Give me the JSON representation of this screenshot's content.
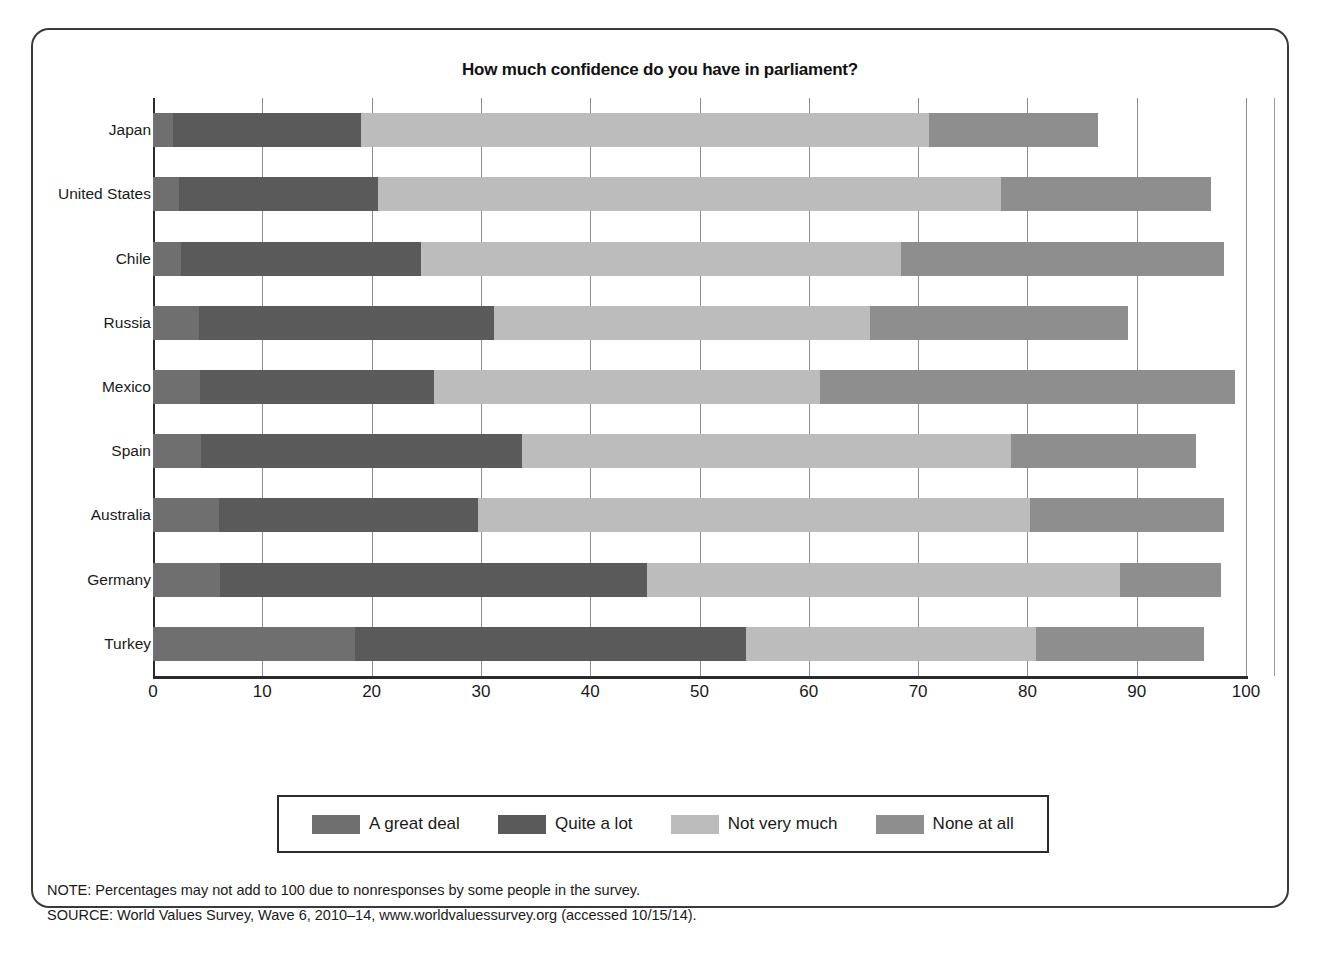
{
  "figure": {
    "title": "How much confidence do you have in parliament?"
  },
  "legend": {
    "items": [
      {
        "label": "A great deal",
        "color": "#6f6f6f"
      },
      {
        "label": "Quite a lot",
        "color": "#5a5a5a"
      },
      {
        "label": "Not very much",
        "color": "#bcbcbc"
      },
      {
        "label": "None at all",
        "color": "#8e8e8e"
      }
    ]
  },
  "footnotes": [
    "NOTE: Percentages may not add to 100 due to nonresponses by some people in the survey.",
    "SOURCE: World Values Survey, Wave 6, 2010–14, www.worldvaluessurvey.org (accessed 10/15/14)."
  ],
  "chart_data": {
    "type": "bar",
    "orientation": "horizontal",
    "stacked": true,
    "title": "How much confidence do you have in parliament?",
    "xlabel": "",
    "ylabel": "",
    "xlim": [
      0,
      100
    ],
    "xticks": [
      0,
      10,
      20,
      30,
      40,
      50,
      60,
      70,
      80,
      90,
      100
    ],
    "grid": true,
    "legend_position": "bottom",
    "categories": [
      "Japan",
      "United States",
      "Chile",
      "Russia",
      "Mexico",
      "Spain",
      "Australia",
      "Germany",
      "Turkey"
    ],
    "series": [
      {
        "name": "A great deal",
        "color": "#6f6f6f",
        "values": [
          1.8,
          2.4,
          2.6,
          4.2,
          4.3,
          4.4,
          6.0,
          6.1,
          18.5
        ]
      },
      {
        "name": "Quite a lot",
        "color": "#5a5a5a",
        "values": [
          17.2,
          18.2,
          21.9,
          27.0,
          21.4,
          29.4,
          23.7,
          39.1,
          35.8
        ]
      },
      {
        "name": "Not very much",
        "color": "#bcbcbc",
        "values": [
          52.0,
          57.0,
          43.9,
          34.4,
          35.3,
          44.7,
          50.5,
          43.3,
          26.5
        ]
      },
      {
        "name": "None at all",
        "color": "#8e8e8e",
        "values": [
          15.5,
          19.2,
          29.6,
          23.6,
          38.0,
          16.9,
          17.8,
          9.2,
          15.4
        ]
      }
    ],
    "totals": [
      86.5,
      96.8,
      98.0,
      89.2,
      99.0,
      95.4,
      98.0,
      97.7,
      96.2
    ]
  }
}
